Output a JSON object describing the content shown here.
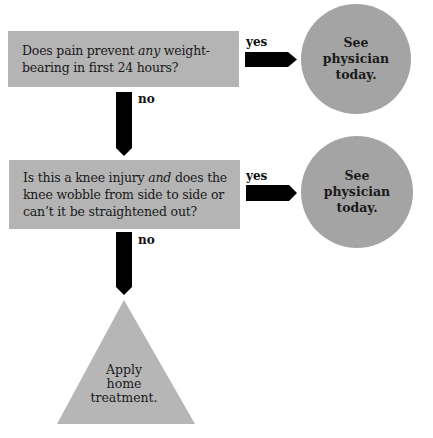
{
  "diagram": {
    "type": "flowchart",
    "nodes": {
      "q1": {
        "shape": "rectangle",
        "text_before": "Does pain prevent ",
        "text_emph": "any",
        "text_after": " weight-bearing in first 24 hours?"
      },
      "r1": {
        "shape": "circle",
        "line1": "See",
        "line2": "physician",
        "line3": "today."
      },
      "q2": {
        "shape": "rectangle",
        "text_before": "Is this a knee injury ",
        "text_emph": "and",
        "text_after": " does the knee wobble from side to side or can’t it be straightened out?"
      },
      "r2": {
        "shape": "circle",
        "line1": "See",
        "line2": "physician",
        "line3": "today."
      },
      "r3": {
        "shape": "triangle",
        "line1": "Apply",
        "line2": "home",
        "line3": "treatment."
      }
    },
    "edges": [
      {
        "from": "q1",
        "to": "r1",
        "label": "yes"
      },
      {
        "from": "q1",
        "to": "q2",
        "label": "no"
      },
      {
        "from": "q2",
        "to": "r2",
        "label": "yes"
      },
      {
        "from": "q2",
        "to": "r3",
        "label": "no"
      }
    ],
    "colors": {
      "box": "#b4b4b4",
      "circle": "#a4a4a4",
      "triangle": "#b6b6b6",
      "arrow": "#000000"
    }
  }
}
